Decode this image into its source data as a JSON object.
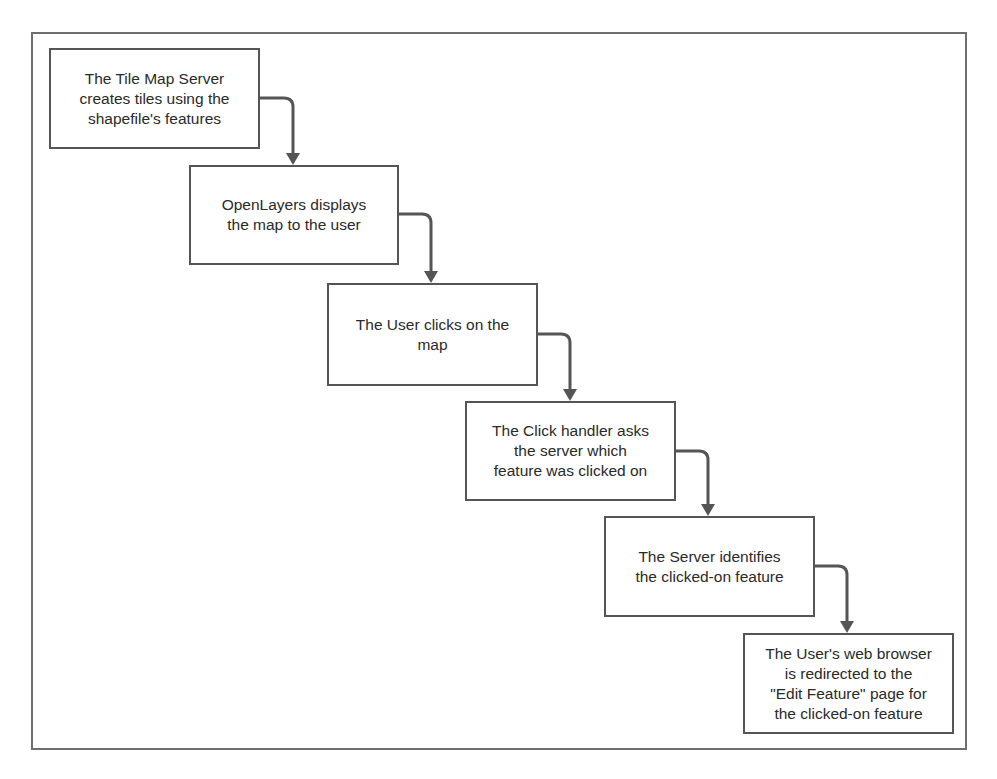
{
  "diagram": {
    "type": "flowchart",
    "direction": "top-left to bottom-right staircase",
    "colors": {
      "stroke": "#555555",
      "arrow": "#555555",
      "frame": "#6e6e6e",
      "text": "#2a2a2a",
      "background": "#ffffff"
    },
    "steps": [
      {
        "id": "step-1",
        "label": "The Tile Map Server\ncreates tiles using the\nshapefile's features"
      },
      {
        "id": "step-2",
        "label": "OpenLayers displays\nthe map to the user"
      },
      {
        "id": "step-3",
        "label": "The User clicks on the\nmap"
      },
      {
        "id": "step-4",
        "label": "The Click handler asks\nthe server which\nfeature was clicked on"
      },
      {
        "id": "step-5",
        "label": "The Server identifies\nthe clicked-on feature"
      },
      {
        "id": "step-6",
        "label": "The User's web browser\nis redirected to the\n\"Edit Feature\" page for\nthe clicked-on feature"
      }
    ],
    "edges": [
      {
        "from": "step-1",
        "to": "step-2"
      },
      {
        "from": "step-2",
        "to": "step-3"
      },
      {
        "from": "step-3",
        "to": "step-4"
      },
      {
        "from": "step-4",
        "to": "step-5"
      },
      {
        "from": "step-5",
        "to": "step-6"
      }
    ]
  }
}
